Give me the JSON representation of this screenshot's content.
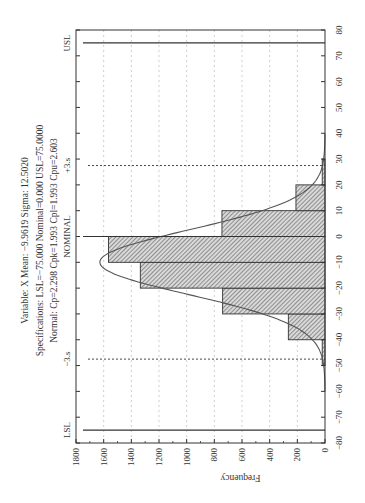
{
  "chart_data": {
    "type": "bar",
    "orientation_note": "figure rotated 90 degrees counter-clockwise",
    "title_lines": [
      "Variable: X        Mean: −9.9619    Sigma: 12.5020",
      "Specifications: LSL=−75.000 Nominal=0.000 USL=75.0000",
      "Normal: Cp=2.298 Cpk=1.993 Cpl=1.993 Cpu=2.603"
    ],
    "xlabel": "",
    "ylabel": "Frequency",
    "xlim": [
      -80,
      80
    ],
    "ylim": [
      0,
      1800
    ],
    "x_ticks": [
      -80,
      -70,
      -60,
      -50,
      -40,
      -30,
      -20,
      -10,
      0,
      10,
      20,
      30,
      40,
      50,
      60,
      70,
      80
    ],
    "y_ticks": [
      0,
      200,
      400,
      600,
      800,
      1000,
      1200,
      1400,
      1600,
      1800
    ],
    "grid": true,
    "bins": [
      {
        "from": -50,
        "to": -40,
        "value": 20
      },
      {
        "from": -40,
        "to": -30,
        "value": 265
      },
      {
        "from": -30,
        "to": -20,
        "value": 740
      },
      {
        "from": -20,
        "to": -10,
        "value": 1335
      },
      {
        "from": -10,
        "to": 0,
        "value": 1565
      },
      {
        "from": 0,
        "to": 10,
        "value": 745
      },
      {
        "from": 10,
        "to": 20,
        "value": 210
      },
      {
        "from": 20,
        "to": 30,
        "value": 20
      }
    ],
    "normal_curve": {
      "mean": -9.9619,
      "sigma": 12.502,
      "bin_width": 10,
      "n": 5100
    },
    "reference_lines": [
      {
        "label": "LSL",
        "value": -75,
        "style": "solid"
      },
      {
        "label": "−3.s",
        "value": -47.5,
        "style": "dashed"
      },
      {
        "label": "NOMINAL",
        "value": 0,
        "style": "solid"
      },
      {
        "label": "+3.s",
        "value": 27.5,
        "style": "dashed"
      },
      {
        "label": "USL",
        "value": 75,
        "style": "solid"
      }
    ],
    "stats": {
      "variable": "X",
      "mean": -9.9619,
      "sigma": 12.502,
      "lsl": -75.0,
      "nominal": 0.0,
      "usl": 75.0,
      "cp": 2.298,
      "cpk": 1.993,
      "cpl": 1.993,
      "cpu": 2.603
    }
  },
  "colors": {
    "axis": "#333333",
    "grid": "#bbbbbb",
    "bar_fill": "#cfcfcf",
    "bar_hatch": "#444444",
    "curve": "#555555"
  }
}
